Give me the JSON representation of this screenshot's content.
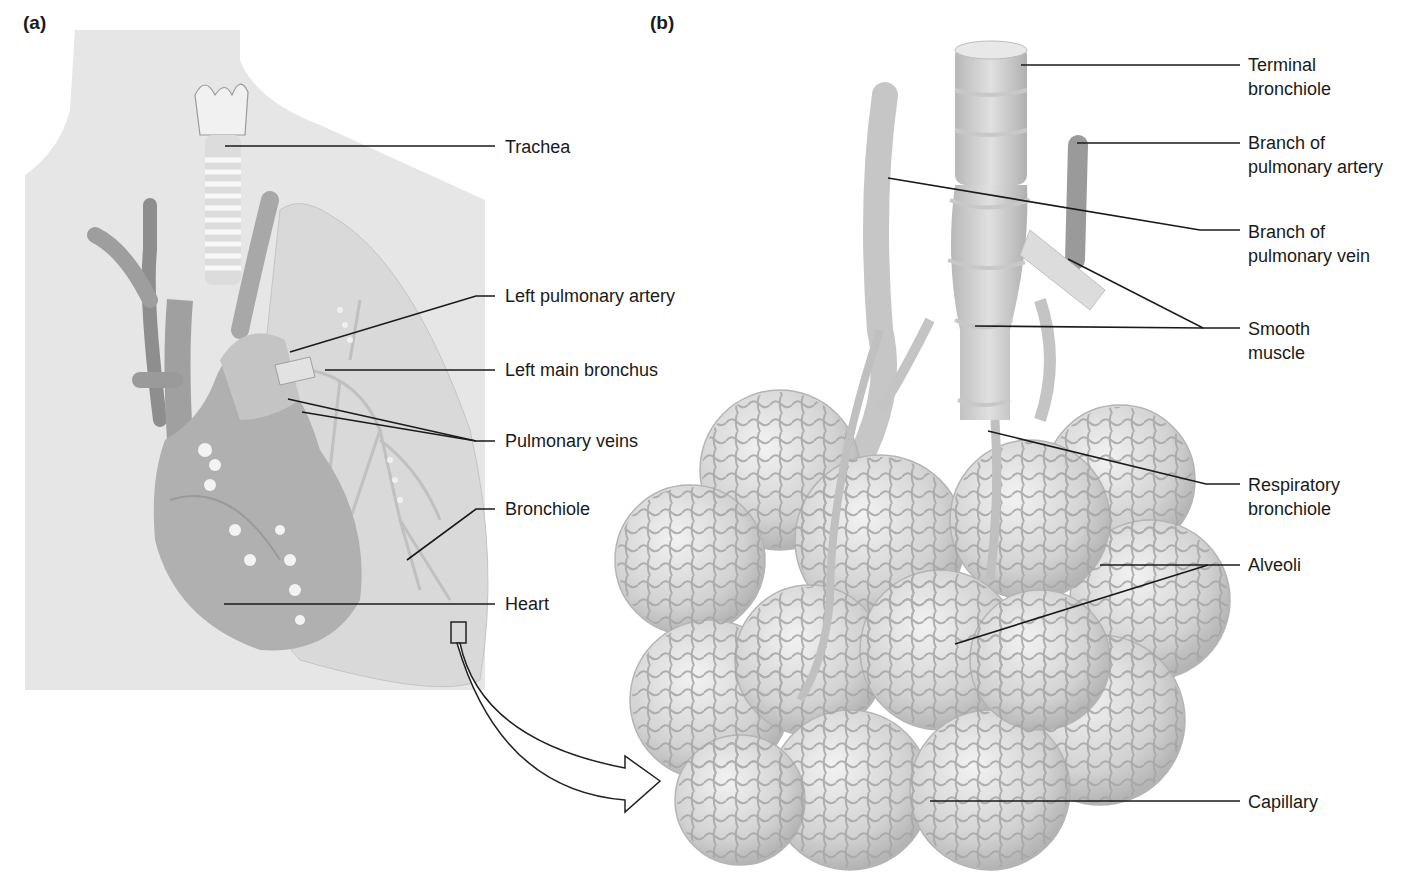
{
  "figure": {
    "panels": [
      {
        "id": "a",
        "label": "(a)"
      },
      {
        "id": "b",
        "label": "(b)"
      }
    ],
    "colors": {
      "background": "#ffffff",
      "torso": "#e4e4e4",
      "organ": "#bdbdbd",
      "organ_dark": "#8f8f8f",
      "lung": "#d6d6d6",
      "alveoli": "#cfcfcf",
      "capillary": "#a8a8a8",
      "leader_line": "#1a1a1a",
      "label_text": "#1a1a1a"
    }
  },
  "panel_a": {
    "labels": [
      {
        "text": "Trachea"
      },
      {
        "text": "Left pulmonary artery"
      },
      {
        "text": "Left main bronchus"
      },
      {
        "text": "Pulmonary veins"
      },
      {
        "text": "Bronchiole"
      },
      {
        "text": "Heart"
      }
    ]
  },
  "panel_b": {
    "labels": [
      {
        "line1": "Terminal",
        "line2": "bronchiole"
      },
      {
        "line1": "Branch of",
        "line2": "pulmonary artery"
      },
      {
        "line1": "Branch of",
        "line2": "pulmonary vein"
      },
      {
        "line1": "Smooth",
        "line2": "muscle"
      },
      {
        "line1": "Respiratory",
        "line2": "bronchiole"
      },
      {
        "line1": "Alveoli",
        "line2": ""
      },
      {
        "line1": "Capillary",
        "line2": ""
      }
    ]
  },
  "callout": {
    "icon": "magnify-region-arrow-icon"
  }
}
